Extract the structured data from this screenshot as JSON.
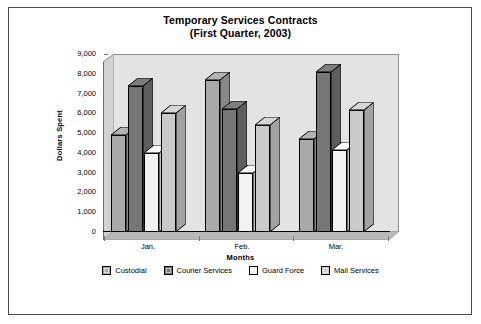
{
  "title": {
    "line1": "Temporary Services Contracts",
    "line2": "(First Quarter, 2003)"
  },
  "axes": {
    "y_title": "Dollars Spent",
    "x_title": "Months",
    "y_ticks": [
      "9,000",
      "8,000",
      "7,000",
      "6,000",
      "5,000",
      "4,000",
      "3,000",
      "2,000",
      "1,000",
      "0"
    ],
    "x_categories": [
      "Jan.",
      "Feb.",
      "Mar."
    ]
  },
  "legend": {
    "items": [
      {
        "label": "Custodial",
        "color": "#a9a9a9"
      },
      {
        "label": "Courier Services",
        "color": "#767676"
      },
      {
        "label": "Guard Force",
        "color": "#f2f2f2"
      },
      {
        "label": "Mail Services",
        "color": "#cacaca"
      }
    ]
  },
  "colors": {
    "plot_back_wall": "#e3e3e3",
    "plot_floor": "#b8b8b8",
    "frame_border": "#4a4a4a",
    "axis_line": "#000000"
  },
  "chart_data": {
    "type": "bar",
    "title": "Temporary Services Contracts (First Quarter, 2003)",
    "xlabel": "Months",
    "ylabel": "Dollars Spent",
    "ylim": [
      0,
      9000
    ],
    "ytick_interval": 1000,
    "grid": false,
    "legend_position": "bottom",
    "three_d": true,
    "categories": [
      "Jan.",
      "Feb.",
      "Mar."
    ],
    "series": [
      {
        "name": "Custodial",
        "color": "#a9a9a9",
        "values": [
          4900,
          7700,
          4700
        ]
      },
      {
        "name": "Courier Services",
        "color": "#767676",
        "values": [
          7400,
          6200,
          8100
        ]
      },
      {
        "name": "Guard Force",
        "color": "#f2f2f2",
        "values": [
          4000,
          3000,
          4150
        ]
      },
      {
        "name": "Mail Services",
        "color": "#cacaca",
        "values": [
          6000,
          5400,
          6150
        ]
      }
    ]
  }
}
